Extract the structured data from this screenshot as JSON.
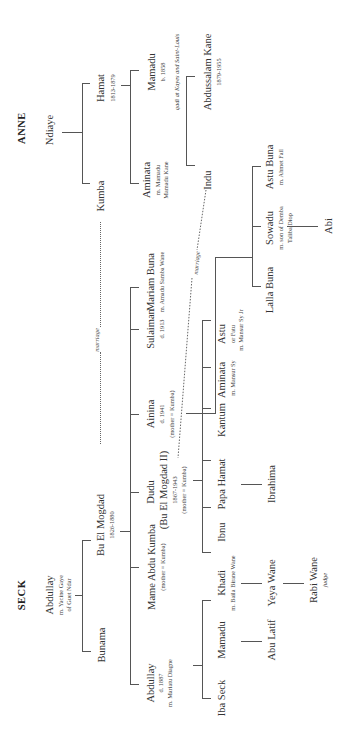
{
  "families": {
    "anne": {
      "title": "ANNE"
    },
    "seck": {
      "title": "SECK"
    }
  },
  "anne": {
    "ndiaye": {
      "name": "Ndiaye"
    },
    "hamat": {
      "name": "Hamat",
      "dates": "1813-1879"
    },
    "kumba": {
      "name": "Kumba"
    },
    "mamadu": {
      "name": "Mamadu",
      "born": "b. 1858",
      "note": "qadi at Kayes and Saint-Louis"
    },
    "aminata": {
      "name": "Aminata",
      "spouse1": "m. Mamadu",
      "spouse2": "Mamadu Kane"
    },
    "abdussalam": {
      "name": "Abdussalam Kane",
      "dates": "1879-1955"
    },
    "indu": {
      "name": "Indu"
    }
  },
  "seck": {
    "abdullay": {
      "name": "Abdullay",
      "spouse1": "m. Yacine Gaye",
      "spouse2": "of Guet Ndar"
    },
    "bunama": {
      "name": "Bunama"
    },
    "bu_el_mogdad": {
      "name": "Bu El Mogdad",
      "dates": "1826-1880"
    },
    "gen3": {
      "abdullay": {
        "name": "Abdullay",
        "death": "d. 1887",
        "spouse": "m. Mariatu Diagne"
      },
      "mame_abdu_kumba": {
        "name": "Mame Abdu Kumba",
        "note": "(mother = Kumba)"
      },
      "dudu": {
        "name": "Dudu",
        "alias": "(Bu El Mogdad II)",
        "dates": "1867-1943",
        "note": "(mother = Kumba)"
      },
      "ainina": {
        "name": "Ainina",
        "death": "d. 1941",
        "note": "(mother = Kumba)"
      },
      "sulaiman": {
        "name": "Sulaiman",
        "death": "d. 1913"
      },
      "mariam_buna": {
        "name": "Mariam Buna",
        "spouse": "m. Amadu Samba Wane"
      }
    },
    "gen4": {
      "iba_seck": {
        "name": "Iba Seck"
      },
      "mamadu": {
        "name": "Mamadu"
      },
      "khadi": {
        "name": "Khadi",
        "spouse": "m. Baila Birane Wane"
      },
      "ibnu": {
        "name": "Ibnu"
      },
      "papa_hamat": {
        "name": "Papa Hamat"
      },
      "kantum": {
        "name": "Kantum"
      },
      "aminata": {
        "name": "Aminata",
        "spouse": "m. Mansur Sy"
      },
      "astu": {
        "name": "Astu",
        "alias": "or Fatu",
        "spouse": "m. Mansur Sy Jr"
      },
      "lalla_buna": {
        "name": "Lalla Buna"
      },
      "sowadu": {
        "name": "Sowadu",
        "spouse1": "m. son of Demba",
        "spouse2": "Taliba Diop"
      },
      "astu_buna": {
        "name": "Astu Buna",
        "spouse": "m. Ahmet Fall"
      }
    },
    "gen5": {
      "abu_latif": {
        "name": "Abu Latif"
      },
      "yeya_wane": {
        "name": "Yeya Wane"
      },
      "ibrahima": {
        "name": "Ibrahima"
      },
      "abi": {
        "name": "Abi"
      }
    },
    "gen6": {
      "rabi_wane": {
        "name": "Rabi Wane",
        "note": "judge"
      }
    }
  },
  "links": {
    "marriage_1": "marriage",
    "marriage_2": "marriage"
  }
}
